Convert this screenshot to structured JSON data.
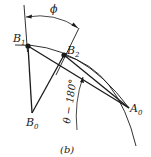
{
  "figure": {
    "caption": "(b)",
    "points": {
      "B1": {
        "label": "B",
        "sub": "1"
      },
      "B2": {
        "label": "B",
        "sub": "2"
      },
      "B0": {
        "label": "B",
        "sub": "0"
      },
      "A0": {
        "label": "A",
        "sub": "0"
      }
    },
    "angles": {
      "phi": "ϕ",
      "theta_minus_180": "θ − 180°"
    }
  }
}
